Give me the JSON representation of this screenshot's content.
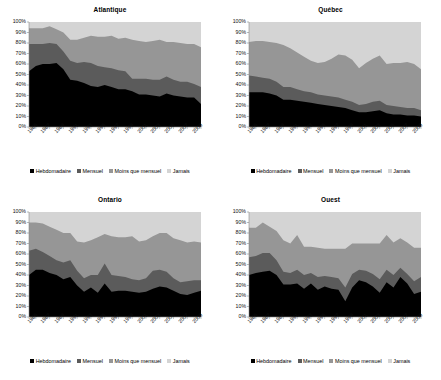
{
  "figure": {
    "panel_titles": [
      "Atlantique",
      "Québec",
      "Ontario",
      "Ouest"
    ]
  },
  "legend": {
    "items": [
      {
        "label": "Hebdomadaire",
        "color": "#000000"
      },
      {
        "label": "Mensuel",
        "color": "#5b5b5b"
      },
      {
        "label": "Moins que mensuel",
        "color": "#969696"
      },
      {
        "label": "Jamais",
        "color": "#d4d4d4"
      }
    ]
  },
  "axis": {
    "yticks": [
      "100%",
      "90%",
      "80%",
      "70%",
      "60%",
      "50%",
      "40%",
      "30%",
      "20%",
      "10%",
      "0%"
    ],
    "xticks": [
      "1985",
      "1987",
      "1989",
      "1991",
      "1993",
      "1995",
      "1997",
      "1999",
      "2001",
      "2003",
      "2005",
      "2007",
      "2009"
    ]
  },
  "chart_data": [
    {
      "type": "area",
      "title": "Atlantique",
      "xlabel": "",
      "ylabel": "",
      "ylim": [
        0,
        100
      ],
      "grid": false,
      "stacked": true,
      "legend_position": "bottom",
      "x": [
        1985,
        1986,
        1987,
        1988,
        1989,
        1990,
        1991,
        1992,
        1993,
        1994,
        1995,
        1996,
        1997,
        1998,
        1999,
        2000,
        2001,
        2002,
        2003,
        2004,
        2005,
        2006,
        2007,
        2008,
        2009,
        2010
      ],
      "series": [
        {
          "name": "Hebdomadaire",
          "color": "#000000",
          "values": [
            53,
            58,
            60,
            60,
            61,
            55,
            45,
            44,
            42,
            39,
            38,
            40,
            38,
            36,
            36,
            34,
            31,
            31,
            30,
            29,
            32,
            30,
            29,
            28,
            28,
            22
          ]
        },
        {
          "name": "Mensuel",
          "color": "#5b5b5b",
          "values": [
            26,
            21,
            19,
            20,
            18,
            17,
            18,
            17,
            20,
            22,
            20,
            17,
            18,
            18,
            17,
            12,
            15,
            15,
            15,
            16,
            16,
            15,
            14,
            15,
            13,
            16
          ]
        },
        {
          "name": "Moins que mensuel",
          "color": "#969696",
          "values": [
            15,
            15,
            15,
            16,
            14,
            18,
            20,
            22,
            23,
            26,
            28,
            29,
            31,
            30,
            32,
            37,
            36,
            35,
            37,
            38,
            33,
            36,
            37,
            36,
            38,
            38
          ]
        },
        {
          "name": "Jamais",
          "color": "#d4d4d4",
          "values": [
            6,
            6,
            6,
            4,
            7,
            10,
            17,
            17,
            15,
            13,
            14,
            14,
            13,
            16,
            15,
            17,
            18,
            19,
            18,
            17,
            19,
            19,
            20,
            21,
            21,
            24
          ]
        }
      ]
    },
    {
      "type": "area",
      "title": "Québec",
      "xlabel": "",
      "ylabel": "",
      "ylim": [
        0,
        100
      ],
      "grid": false,
      "stacked": true,
      "legend_position": "bottom",
      "x": [
        1985,
        1986,
        1987,
        1988,
        1989,
        1990,
        1991,
        1992,
        1993,
        1994,
        1995,
        1996,
        1997,
        1998,
        1999,
        2000,
        2001,
        2002,
        2003,
        2004,
        2005,
        2006,
        2007,
        2008,
        2009,
        2010
      ],
      "series": [
        {
          "name": "Hebdomadaire",
          "color": "#000000",
          "values": [
            33,
            33,
            33,
            32,
            30,
            26,
            26,
            25,
            24,
            23,
            22,
            21,
            20,
            19,
            18,
            16,
            14,
            14,
            15,
            16,
            13,
            12,
            12,
            11,
            11,
            10
          ]
        },
        {
          "name": "Mensuel",
          "color": "#5b5b5b",
          "values": [
            16,
            15,
            14,
            14,
            13,
            12,
            12,
            11,
            10,
            10,
            9,
            9,
            9,
            9,
            8,
            8,
            7,
            8,
            9,
            9,
            8,
            8,
            7,
            7,
            7,
            6
          ]
        },
        {
          "name": "Moins que mensuel",
          "color": "#969696",
          "values": [
            32,
            34,
            35,
            35,
            37,
            40,
            37,
            35,
            33,
            30,
            30,
            32,
            36,
            41,
            42,
            40,
            35,
            39,
            41,
            43,
            39,
            41,
            42,
            44,
            42,
            39
          ]
        },
        {
          "name": "Jamais",
          "color": "#d4d4d4",
          "values": [
            19,
            18,
            18,
            19,
            20,
            22,
            25,
            29,
            33,
            37,
            39,
            38,
            35,
            31,
            32,
            36,
            44,
            39,
            35,
            32,
            40,
            39,
            39,
            38,
            40,
            45
          ]
        }
      ]
    },
    {
      "type": "area",
      "title": "Ontario",
      "xlabel": "",
      "ylabel": "",
      "ylim": [
        0,
        100
      ],
      "grid": false,
      "stacked": true,
      "legend_position": "bottom",
      "x": [
        1985,
        1986,
        1987,
        1988,
        1989,
        1990,
        1991,
        1992,
        1993,
        1994,
        1995,
        1996,
        1997,
        1998,
        1999,
        2000,
        2001,
        2002,
        2003,
        2004,
        2005,
        2006,
        2007,
        2008,
        2009,
        2010
      ],
      "series": [
        {
          "name": "Hebdomadaire",
          "color": "#000000",
          "values": [
            40,
            45,
            45,
            42,
            40,
            36,
            38,
            30,
            24,
            28,
            23,
            32,
            24,
            25,
            25,
            24,
            23,
            24,
            27,
            29,
            28,
            25,
            22,
            21,
            23,
            25
          ]
        },
        {
          "name": "Mensuel",
          "color": "#5b5b5b",
          "values": [
            23,
            20,
            17,
            16,
            14,
            16,
            16,
            14,
            13,
            12,
            17,
            19,
            16,
            14,
            13,
            12,
            12,
            13,
            17,
            16,
            15,
            12,
            11,
            13,
            12,
            10
          ]
        },
        {
          "name": "Moins que mensuel",
          "color": "#969696",
          "values": [
            27,
            25,
            27,
            28,
            29,
            28,
            26,
            28,
            34,
            33,
            36,
            28,
            37,
            37,
            38,
            41,
            37,
            36,
            33,
            35,
            37,
            38,
            40,
            37,
            37,
            36
          ]
        },
        {
          "name": "Jamais",
          "color": "#d4d4d4",
          "values": [
            10,
            10,
            11,
            14,
            17,
            20,
            20,
            28,
            29,
            27,
            24,
            21,
            23,
            24,
            24,
            23,
            28,
            27,
            23,
            20,
            20,
            25,
            27,
            29,
            28,
            29
          ]
        }
      ]
    },
    {
      "type": "area",
      "title": "Ouest",
      "xlabel": "",
      "ylabel": "",
      "ylim": [
        0,
        100
      ],
      "grid": false,
      "stacked": true,
      "legend_position": "bottom",
      "x": [
        1985,
        1986,
        1987,
        1988,
        1989,
        1990,
        1991,
        1992,
        1993,
        1994,
        1995,
        1996,
        1997,
        1998,
        1999,
        2000,
        2001,
        2002,
        2003,
        2004,
        2005,
        2006,
        2007,
        2008,
        2009,
        2010
      ],
      "series": [
        {
          "name": "Hebdomadaire",
          "color": "#000000",
          "values": [
            40,
            42,
            43,
            44,
            40,
            31,
            31,
            32,
            27,
            32,
            26,
            29,
            27,
            26,
            15,
            28,
            35,
            33,
            29,
            23,
            33,
            28,
            38,
            32,
            22,
            24
          ]
        },
        {
          "name": "Mensuel",
          "color": "#5b5b5b",
          "values": [
            17,
            16,
            18,
            17,
            14,
            12,
            11,
            13,
            13,
            10,
            12,
            10,
            11,
            11,
            13,
            13,
            10,
            11,
            12,
            13,
            12,
            12,
            9,
            9,
            12,
            14
          ]
        },
        {
          "name": "Moins que mensuel",
          "color": "#969696",
          "values": [
            28,
            27,
            29,
            25,
            28,
            30,
            28,
            33,
            27,
            25,
            28,
            26,
            27,
            28,
            37,
            29,
            25,
            26,
            29,
            34,
            33,
            31,
            28,
            30,
            32,
            28
          ]
        },
        {
          "name": "Jamais",
          "color": "#d4d4d4",
          "values": [
            15,
            15,
            10,
            14,
            18,
            27,
            30,
            22,
            33,
            33,
            34,
            35,
            35,
            35,
            35,
            30,
            30,
            30,
            30,
            30,
            22,
            29,
            25,
            29,
            34,
            34
          ]
        }
      ]
    }
  ]
}
